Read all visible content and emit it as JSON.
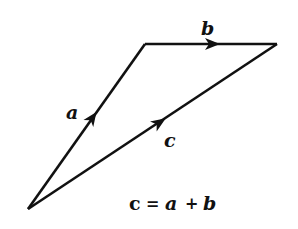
{
  "diagram": {
    "type": "vector-addition-triangle",
    "stroke_color": "#111111",
    "background": "#ffffff",
    "vertices": {
      "origin": [
        28,
        209
      ],
      "top_left": [
        145,
        44
      ],
      "right": [
        276,
        44
      ]
    },
    "vectors": [
      {
        "name": "a",
        "label": "a",
        "from": "origin",
        "to": "top_left"
      },
      {
        "name": "b",
        "label": "b",
        "from": "top_left",
        "to": "right"
      },
      {
        "name": "c",
        "label": "c",
        "from": "origin",
        "to": "right"
      }
    ],
    "equation": {
      "lhs": "c",
      "eq": "=",
      "t1": "a",
      "plus": "+",
      "t2": "b"
    }
  }
}
